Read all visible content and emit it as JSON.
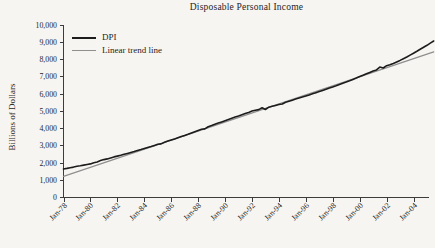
{
  "chart_data": {
    "type": "line",
    "title": "Disposable Personal Income",
    "xlabel": "",
    "ylabel": "Billions of Dollars",
    "ylim": [
      0,
      10000
    ],
    "grid": false,
    "legend_position": "top-left",
    "background": "#f7f5f1",
    "axis_color": "#3c3c3c",
    "text_color": "#1f1f1f",
    "y_tick_labels": [
      "0",
      "1,000",
      "2,000",
      "3,000",
      "4,000",
      "5,000",
      "6,000",
      "7,000",
      "8,000",
      "9,000",
      "10,000"
    ],
    "x_tick_labels": [
      "Jan-78",
      "Jan-80",
      "Jan-82",
      "Jan-84",
      "Jan-86",
      "Jan-88",
      "Jan-90",
      "Jan-92",
      "Jan-94",
      "Jan-96",
      "Jan-98",
      "Jan-00",
      "Jan-02",
      "Jan-04"
    ],
    "x_tick_years": [
      1978,
      1980,
      1982,
      1984,
      1986,
      1988,
      1990,
      1992,
      1994,
      1996,
      1998,
      2000,
      2002,
      2004
    ],
    "series": [
      {
        "name": "DPI",
        "color": "#1c1c1c",
        "width": 1.6,
        "x_start": 1978,
        "x_step": 0.25,
        "y": [
          1650,
          1685,
          1730,
          1762,
          1815,
          1845,
          1878,
          1915,
          1950,
          2015,
          2060,
          2140,
          2195,
          2238,
          2298,
          2352,
          2398,
          2448,
          2502,
          2558,
          2610,
          2662,
          2718,
          2778,
          2840,
          2902,
          2958,
          3022,
          3085,
          3105,
          3200,
          3268,
          3335,
          3398,
          3462,
          3532,
          3600,
          3662,
          3738,
          3812,
          3890,
          3958,
          3975,
          4098,
          4168,
          4242,
          4312,
          4382,
          4455,
          4522,
          4592,
          4658,
          4725,
          4792,
          4862,
          4932,
          5008,
          5058,
          5098,
          5200,
          5100,
          5232,
          5288,
          5338,
          5390,
          5420,
          5518,
          5580,
          5642,
          5702,
          5762,
          5822,
          5885,
          5948,
          6012,
          6075,
          6138,
          6205,
          6272,
          6340,
          6408,
          6478,
          6548,
          6618,
          6690,
          6768,
          6848,
          6930,
          7012,
          7092,
          7172,
          7252,
          7332,
          7398,
          7562,
          7508,
          7638,
          7698,
          7775,
          7858,
          7948,
          8048,
          8145,
          8255,
          8368,
          8478,
          8590,
          8705,
          8825,
          8948,
          9075
        ]
      },
      {
        "name": "Linear trend line",
        "color": "#8f8f8f",
        "width": 1.3,
        "x": [
          1978,
          2005.5
        ],
        "y": [
          1230,
          8440
        ]
      }
    ]
  }
}
